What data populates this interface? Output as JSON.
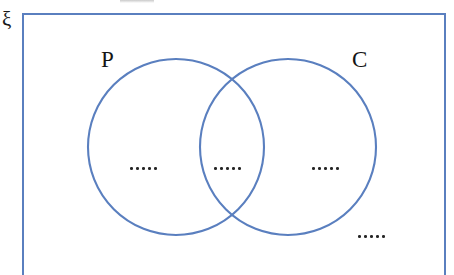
{
  "diagram": {
    "type": "venn",
    "kind": "two-set-venn-diagram",
    "universal_set_label": "ξ",
    "sets": [
      {
        "id": "P",
        "label": "P",
        "cx": 176,
        "cy": 147,
        "r": 88
      },
      {
        "id": "C",
        "label": "C",
        "cx": 288,
        "cy": 147,
        "r": 88
      }
    ],
    "regions": [
      {
        "id": "p-only",
        "label": "·····",
        "dots": 5,
        "description": "in P only"
      },
      {
        "id": "overlap",
        "label": "·····",
        "dots": 5,
        "description": "in P and C"
      },
      {
        "id": "c-only",
        "label": "·····",
        "dots": 5,
        "description": "in C only"
      },
      {
        "id": "outside",
        "label": "·····",
        "dots": 5,
        "description": "outside both sets"
      }
    ],
    "colors": {
      "stroke": "#5A7FBF",
      "rect_border": "#5A7FBF",
      "text": "#151515",
      "dot": "#262626",
      "background": "#ffffff"
    },
    "canvas": {
      "width": 454,
      "height": 275
    }
  }
}
